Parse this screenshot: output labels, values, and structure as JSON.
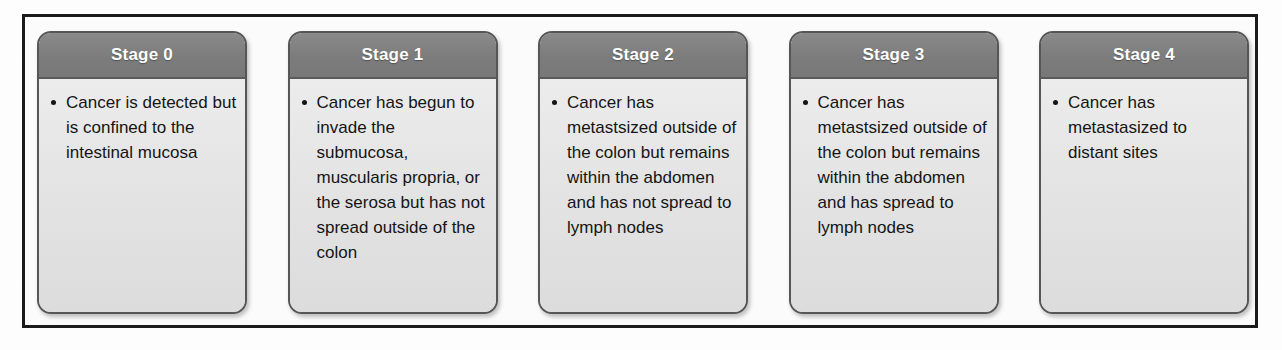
{
  "diagram": {
    "type": "stage-cards-row",
    "colors": {
      "frame_border": "#1b1b1b",
      "card_border": "#565656",
      "header_background": "#7c7c7c",
      "header_text": "#ffffff",
      "body_background": "#e4e4e4",
      "body_text": "#151515",
      "page_background": "#fdfdfd"
    },
    "cards": [
      {
        "header": "Stage 0",
        "bullets": [
          "Cancer is detected but is confined to the intestinal mucosa"
        ]
      },
      {
        "header": "Stage 1",
        "bullets": [
          "Cancer has begun to invade the submucosa, muscularis propria, or the serosa but has not spread outside of the colon"
        ]
      },
      {
        "header": "Stage 2",
        "bullets": [
          "Cancer has metastsized outside of the colon but remains within the abdomen and has not spread to lymph nodes"
        ]
      },
      {
        "header": "Stage 3",
        "bullets": [
          "Cancer has metastsized outside of the colon but remains within the abdomen and has spread to lymph nodes"
        ]
      },
      {
        "header": "Stage 4",
        "bullets": [
          "Cancer has metastasized to distant sites"
        ]
      }
    ]
  }
}
